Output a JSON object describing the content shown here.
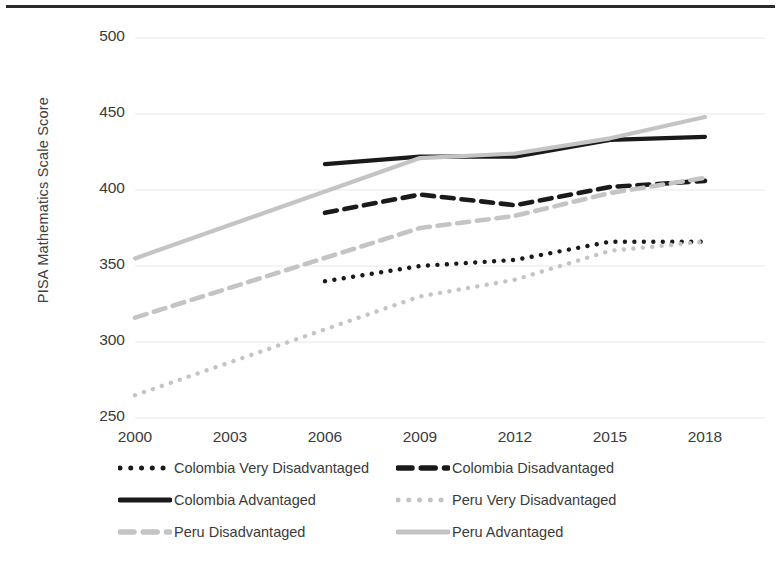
{
  "chart_data": {
    "type": "line",
    "title": "",
    "subtitle": "",
    "xlabel": "",
    "ylabel": "PISA Mathematics Scale Score",
    "x": [
      2000,
      2003,
      2006,
      2009,
      2012,
      2015,
      2018
    ],
    "xtick_labels": [
      "2000",
      "2003",
      "2006",
      "2009",
      "2012",
      "2015",
      "2018"
    ],
    "ytick_labels": [
      "250",
      "300",
      "350",
      "400",
      "450",
      "500"
    ],
    "ytick_values": [
      250,
      300,
      350,
      400,
      450,
      500
    ],
    "ylim": [
      250,
      500
    ],
    "xlim": [
      2000,
      2018
    ],
    "grid": "horizontal",
    "legend_position": "bottom",
    "legend_columns": 2,
    "series": [
      {
        "name": "Colombia Very Disadvantaged",
        "style": "dotted",
        "color": "#1a1a1a",
        "x": [
          2006,
          2009,
          2012,
          2015,
          2018
        ],
        "values": [
          340,
          350,
          354,
          366,
          366
        ]
      },
      {
        "name": "Colombia Disadvantaged",
        "style": "dashed",
        "color": "#1a1a1a",
        "x": [
          2006,
          2009,
          2012,
          2015,
          2018
        ],
        "values": [
          385,
          397,
          390,
          402,
          406
        ]
      },
      {
        "name": "Colombia Advantaged",
        "style": "solid",
        "color": "#1a1a1a",
        "x": [
          2006,
          2009,
          2012,
          2015,
          2018
        ],
        "values": [
          417,
          422,
          422,
          433,
          435
        ]
      },
      {
        "name": "Peru Very Disadvantaged",
        "style": "dotted",
        "color": "#c4c4c4",
        "x": [
          2000,
          2009,
          2012,
          2015,
          2018
        ],
        "values": [
          265,
          330,
          341,
          360,
          366
        ]
      },
      {
        "name": "Peru Disadvantaged",
        "style": "dashed",
        "color": "#c4c4c4",
        "x": [
          2000,
          2009,
          2012,
          2015,
          2018
        ],
        "values": [
          316,
          375,
          383,
          398,
          408
        ]
      },
      {
        "name": "Peru Advantaged",
        "style": "solid",
        "color": "#c4c4c4",
        "x": [
          2000,
          2009,
          2012,
          2015,
          2018
        ],
        "values": [
          355,
          421,
          424,
          434,
          448
        ]
      }
    ]
  },
  "axis": {
    "ylabel": "PISA Mathematics Scale Score",
    "yticks": [
      "500",
      "450",
      "400",
      "350",
      "300",
      "250"
    ],
    "xticks": [
      "2000",
      "2003",
      "2006",
      "2009",
      "2012",
      "2015",
      "2018"
    ]
  },
  "legend": {
    "entries": [
      {
        "label": "Colombia Very Disadvantaged",
        "style": "dotted",
        "color": "#1a1a1a"
      },
      {
        "label": "Colombia Disadvantaged",
        "style": "dashed",
        "color": "#1a1a1a"
      },
      {
        "label": "Colombia Advantaged",
        "style": "solid",
        "color": "#1a1a1a"
      },
      {
        "label": "Peru Very Disadvantaged",
        "style": "dotted",
        "color": "#c4c4c4"
      },
      {
        "label": "Peru Disadvantaged",
        "style": "dashed",
        "color": "#c4c4c4"
      },
      {
        "label": "Peru Advantaged",
        "style": "solid",
        "color": "#c4c4c4"
      }
    ]
  },
  "colors": {
    "colombia": "#1a1a1a",
    "peru": "#c4c4c4",
    "gridline": "#e8e8e8",
    "text": "#3b3b3b",
    "rule": "#2b2b2b"
  }
}
